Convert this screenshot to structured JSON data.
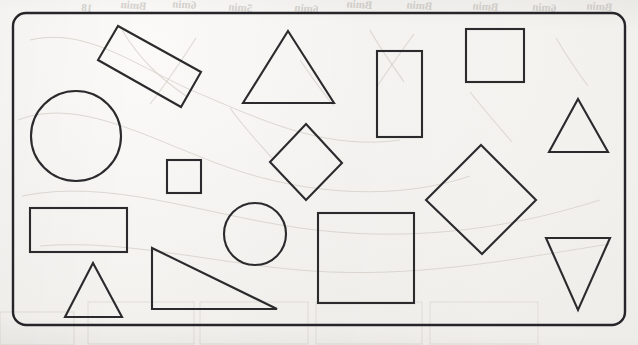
{
  "page": {
    "background_color": "#f3f2ef",
    "ink_color": "#2b2b2e",
    "bleed_color": "#b9b4ae",
    "width": 638,
    "height": 345
  },
  "frame": {
    "name": "rounded-rectangle-border",
    "x": 13,
    "y": 13,
    "width": 612,
    "height": 312,
    "corner_radius": 13,
    "stroke_color": "#25252a"
  },
  "bleed_through": {
    "note": "faint mirrored show-through text from the reverse side of the sheet",
    "items": [
      {
        "text": "Bmin",
        "x": 92,
        "y": 12,
        "rotate": -6,
        "size": 11
      },
      {
        "text": "6min",
        "x": 146,
        "y": 10,
        "rotate": -5,
        "size": 11
      },
      {
        "text": "Bmin",
        "x": 196,
        "y": 9,
        "rotate": -4,
        "size": 11
      },
      {
        "text": "Bmin",
        "x": 252,
        "y": 12,
        "rotate": -4,
        "size": 11
      },
      {
        "text": "Bmin",
        "x": 318,
        "y": 13,
        "rotate": -5,
        "size": 11
      },
      {
        "text": "6min",
        "x": 372,
        "y": 9,
        "rotate": -4,
        "size": 11
      },
      {
        "text": "5min",
        "x": 432,
        "y": 10,
        "rotate": -4,
        "size": 11
      },
      {
        "text": "6min",
        "x": 498,
        "y": 11,
        "rotate": -4,
        "size": 11
      },
      {
        "text": "Bmin",
        "x": 556,
        "y": 12,
        "rotate": -4,
        "size": 11
      },
      {
        "text": "18",
        "x": 612,
        "y": 11,
        "rotate": -4,
        "size": 11
      }
    ]
  },
  "shapes": [
    {
      "id": "rotated-rectangle",
      "type": "rectangle",
      "orientation": "rotated",
      "points": "118,26 201,72 181,107 98,60"
    },
    {
      "id": "large-circle",
      "type": "circle",
      "cx": 76,
      "cy": 136,
      "r": 45
    },
    {
      "id": "equilateral-triangle-top",
      "type": "triangle",
      "orientation": "up",
      "points": "288,31 334,103 243,103"
    },
    {
      "id": "vertical-rectangle",
      "type": "rectangle",
      "orientation": "portrait",
      "x": 377,
      "y": 51,
      "width": 45,
      "height": 86
    },
    {
      "id": "square-top-right",
      "type": "square",
      "x": 466,
      "y": 29,
      "width": 58,
      "height": 53
    },
    {
      "id": "small-triangle-right",
      "type": "triangle",
      "orientation": "up",
      "points": "578,99 608,152 549,152"
    },
    {
      "id": "small-square",
      "type": "square",
      "x": 167,
      "y": 160,
      "width": 34,
      "height": 33
    },
    {
      "id": "small-diamond",
      "type": "diamond",
      "points": "306,124 342,163 306,200 270,162"
    },
    {
      "id": "large-diamond",
      "type": "diamond",
      "points": "481,145 536,200 482,254 426,200"
    },
    {
      "id": "horizontal-rectangle",
      "type": "rectangle",
      "orientation": "landscape",
      "x": 30,
      "y": 208,
      "width": 97,
      "height": 44
    },
    {
      "id": "small-circle",
      "type": "circle",
      "cx": 255,
      "cy": 234,
      "r": 31
    },
    {
      "id": "large-square",
      "type": "square",
      "x": 318,
      "y": 213,
      "width": 96,
      "height": 90
    },
    {
      "id": "inverted-triangle",
      "type": "triangle",
      "orientation": "down",
      "points": "546,238 610,238 578,310"
    },
    {
      "id": "small-triangle-bottom-left",
      "type": "triangle",
      "orientation": "up",
      "points": "93,263 122,317 65,317"
    },
    {
      "id": "right-triangle",
      "type": "triangle",
      "orientation": "right-angle",
      "points": "152,248 152,309 277,309"
    }
  ],
  "summary": {
    "total_shapes": 15,
    "circles": 2,
    "squares": 3,
    "rectangles": 3,
    "triangles": 5,
    "diamonds": 2
  }
}
